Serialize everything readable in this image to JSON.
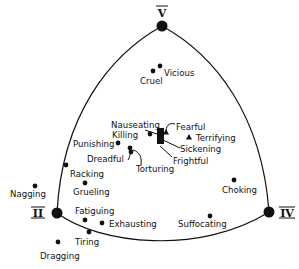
{
  "diagram": {
    "type": "curved triangle perceptual space",
    "vertices": [
      {
        "id": "V",
        "label": "V",
        "x": 162,
        "y": 26,
        "lx": 162,
        "ly": 16
      },
      {
        "id": "II",
        "label": "II",
        "x": 57,
        "y": 213,
        "lx": 38,
        "ly": 217
      },
      {
        "id": "IV",
        "label": "IV",
        "x": 269,
        "y": 212,
        "lx": 286,
        "ly": 217
      }
    ],
    "points": [
      {
        "word": "Vicious",
        "x": 160,
        "y": 66,
        "lx": 164,
        "ly": 76,
        "marker": "dot"
      },
      {
        "word": "Cruel",
        "x": 153,
        "y": 71,
        "lx": 140,
        "ly": 84,
        "marker": "dot"
      },
      {
        "word": "Nauseating",
        "x": 160,
        "y": 132,
        "lx": 111,
        "ly": 128,
        "marker": "pointer"
      },
      {
        "word": "Killing",
        "x": 150,
        "y": 134,
        "lx": 112,
        "ly": 138,
        "marker": "dot"
      },
      {
        "word": "Fearful",
        "x": 166,
        "y": 132,
        "lx": 176,
        "ly": 130,
        "marker": "triangle"
      },
      {
        "word": "Terrifying",
        "x": 189,
        "y": 137,
        "lx": 196,
        "ly": 141,
        "marker": "triangle"
      },
      {
        "word": "Sickening",
        "x": 164,
        "y": 144,
        "lx": 180,
        "ly": 152,
        "marker": "pointer"
      },
      {
        "word": "Frightful",
        "x": 163,
        "y": 149,
        "lx": 173,
        "ly": 164,
        "marker": "pointer"
      },
      {
        "word": "Punishing",
        "x": 118,
        "y": 143,
        "lx": 73,
        "ly": 147,
        "marker": "dot"
      },
      {
        "word": "Dreadful",
        "x": 130,
        "y": 148,
        "lx": 87,
        "ly": 162,
        "marker": "dot"
      },
      {
        "word": "Torturing",
        "x": 131,
        "y": 152,
        "lx": 136,
        "ly": 172,
        "marker": "dot"
      },
      {
        "word": "Racking",
        "x": 66,
        "y": 165,
        "lx": 70,
        "ly": 177,
        "marker": "dot"
      },
      {
        "word": "Grueling",
        "x": 85,
        "y": 183,
        "lx": 73,
        "ly": 195,
        "marker": "dot"
      },
      {
        "word": "Nagging",
        "x": 35,
        "y": 186,
        "lx": 10,
        "ly": 197,
        "marker": "dot"
      },
      {
        "word": "Choking",
        "x": 234,
        "y": 180,
        "lx": 222,
        "ly": 193,
        "marker": "dot"
      },
      {
        "word": "Fatiguing",
        "x": 85,
        "y": 220,
        "lx": 75,
        "ly": 214,
        "marker": "dot"
      },
      {
        "word": "Exhausting",
        "x": 102,
        "y": 223,
        "lx": 109,
        "ly": 227,
        "marker": "dot"
      },
      {
        "word": "Suffocating",
        "x": 210,
        "y": 216,
        "lx": 178,
        "ly": 227,
        "marker": "dot"
      },
      {
        "word": "Tiring",
        "x": 89,
        "y": 232,
        "lx": 75,
        "ly": 245,
        "marker": "dot"
      },
      {
        "word": "Dragging",
        "x": 58,
        "y": 242,
        "lx": 40,
        "ly": 259,
        "marker": "dot"
      }
    ]
  }
}
